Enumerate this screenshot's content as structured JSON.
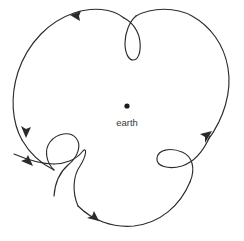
{
  "figure": {
    "kind": "orbit-diagram",
    "width": 244,
    "height": 241,
    "background_color": "#ffffff",
    "stroke_color": "#2b2b2b",
    "stroke_width": 1.15
  },
  "central_body": {
    "label": "earth",
    "label_color": "#3a3a3a",
    "dot_color": "#1a1a1a",
    "dot_x": 127,
    "dot_y": 106,
    "dot_radius": 2.6,
    "label_x": 127,
    "label_y": 126
  },
  "chart_data": {
    "type": "line",
    "title": "",
    "xlabel": "",
    "ylabel": "",
    "center": [
      127,
      106
    ],
    "outer_radius": 112,
    "loop_count": 3,
    "direction": "counterclockwise",
    "loops": [
      {
        "name": "top-loop",
        "cx": 128,
        "cy": 32,
        "width": 14,
        "height": 36,
        "orientation": "vertical-down"
      },
      {
        "name": "right-loop",
        "cx": 182,
        "cy": 148,
        "width": 34,
        "height": 22,
        "orientation": "tilted-left"
      },
      {
        "name": "lower-left-loop-a",
        "cx": 58,
        "cy": 146,
        "width": 34,
        "height": 24,
        "orientation": "tilted-right"
      },
      {
        "name": "lower-left-loop-b",
        "cx": 73,
        "cy": 163,
        "width": 30,
        "height": 24,
        "orientation": "tilted-right"
      }
    ],
    "arrows": [
      {
        "name": "top-left-arrow",
        "x": 75,
        "y": 17,
        "angle": 200,
        "direction": "left"
      },
      {
        "name": "right-arrow",
        "x": 208,
        "y": 134,
        "angle": 305,
        "direction": "up-right"
      },
      {
        "name": "bottom-arrow",
        "x": 92,
        "y": 218,
        "angle": 20,
        "direction": "right-down"
      },
      {
        "name": "left-upper-arrow",
        "x": 27,
        "y": 133,
        "angle": 78,
        "direction": "down"
      },
      {
        "name": "left-lower-arrow",
        "x": 29,
        "y": 163,
        "angle": 35,
        "direction": "down-right"
      }
    ]
  }
}
